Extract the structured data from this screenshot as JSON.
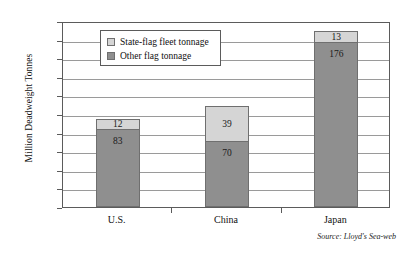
{
  "chart_data": {
    "type": "bar",
    "subtype": "stacked-vertical",
    "title": "",
    "xlabel": "",
    "ylabel": "Million Deadweight Tonnes",
    "ylim": [
      0,
      200
    ],
    "ytick_step": 20,
    "yticks": [
      "200",
      "180",
      "160",
      "140",
      "120",
      "100",
      "80",
      "60",
      "40",
      "20",
      "0"
    ],
    "grid": true,
    "grid_axis": "y",
    "categories": [
      "U.S.",
      "China",
      "Japan"
    ],
    "series": [
      {
        "name": "State-flag fleet tonnage",
        "color": "#d5d5d5",
        "values": [
          12,
          39,
          13
        ],
        "labels": [
          "12",
          "39",
          "13"
        ]
      },
      {
        "name": "Other flag tonnage",
        "color": "#8f8f8f",
        "values": [
          83,
          70,
          176
        ],
        "labels": [
          "83",
          "70",
          "176"
        ]
      }
    ],
    "totals": [
      95,
      109,
      189
    ],
    "legend_position": "top-left-inside",
    "annotations": [
      "Source: Lloyd's Sea-web"
    ]
  },
  "legend": {
    "items": [
      {
        "label": "State-flag fleet tonnage",
        "swatch": "legend-swatch-light-gray"
      },
      {
        "label": "Other flag tonnage",
        "swatch": "legend-swatch-dark-gray"
      }
    ]
  },
  "source": {
    "text": "Source: Lloyd's Sea-web"
  }
}
